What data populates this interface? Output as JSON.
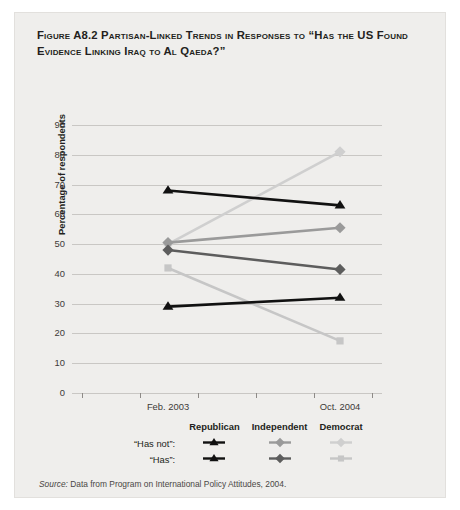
{
  "figure": {
    "number": "Figure A8.2",
    "title": "Figure A8.2 Partisan-Linked Trends in Responses to “Has the US Found Evidence Linking Iraq to Al Qaeda?”",
    "source": "Source: Data from Program on International Policy Attitudes, 2004.",
    "source_prefix": "Source:",
    "source_rest": " Data from Program on International Policy Attitudes, 2004."
  },
  "legend": {
    "columns": [
      "Republican",
      "Independent",
      "Democrat"
    ],
    "rows": [
      "“Has not”:",
      "“Has”:"
    ]
  },
  "colors": {
    "republican_hasnot": "#111111",
    "republican_has": "#111111",
    "independent_hasnot": "#9a9a9a",
    "independent_has": "#5d5d5d",
    "democrat_hasnot": "#cfcfcf",
    "democrat_has": "#c6c6c6",
    "gridline": "#c9c7c4",
    "panel": "#efeeec",
    "text": "#231f20"
  },
  "chart_data": {
    "type": "line",
    "title": "Partisan-Linked Trends in Responses to “Has the US Found Evidence Linking Iraq to Al Qaeda?”",
    "xlabel": "",
    "ylabel": "Percentage of respondents",
    "categories": [
      "Feb. 2003",
      "Oct. 2004"
    ],
    "xticklabels": [
      "Feb. 2003",
      "Oct. 2004"
    ],
    "yticklabels": [
      "0",
      "10",
      "20",
      "30",
      "40",
      "50",
      "60",
      "70",
      "80",
      "90"
    ],
    "ylim": [
      0,
      90
    ],
    "ytick_step": 10,
    "grid": true,
    "legend_position": "bottom",
    "series": [
      {
        "name": "Republican “Has not”",
        "party": "Republican",
        "response": "Has not",
        "marker": "triangle",
        "color": "#111111",
        "values": [
          68,
          63
        ]
      },
      {
        "name": "Republican “Has”",
        "party": "Republican",
        "response": "Has",
        "marker": "triangle",
        "color": "#111111",
        "values": [
          29,
          32
        ]
      },
      {
        "name": "Independent “Has not”",
        "party": "Independent",
        "response": "Has not",
        "marker": "diamond",
        "color": "#9a9a9a",
        "values": [
          50.5,
          55.5
        ]
      },
      {
        "name": "Independent “Has”",
        "party": "Independent",
        "response": "Has",
        "marker": "diamond",
        "color": "#5d5d5d",
        "values": [
          48,
          41.5
        ]
      },
      {
        "name": "Democrat “Has not”",
        "party": "Democrat",
        "response": "Has not",
        "marker": "diamond",
        "color": "#cfcfcf",
        "values": [
          50,
          81
        ]
      },
      {
        "name": "Democrat “Has”",
        "party": "Democrat",
        "response": "Has",
        "marker": "square",
        "color": "#c6c6c6",
        "values": [
          42,
          17.5
        ]
      }
    ]
  }
}
